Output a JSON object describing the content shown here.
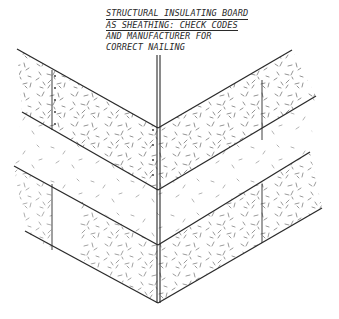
{
  "diagram": {
    "type": "architectural-detail",
    "note": {
      "lines": [
        "STRUCTURAL INSULATING BOARD",
        "AS SHEATHING:  CHECK CODES",
        "AND MANUFACTURER FOR",
        "CORRECT NAILING"
      ]
    },
    "colors": {
      "line": "#2a2a2a",
      "texture": "#4a4a4a",
      "background": "#ffffff"
    },
    "corner": {
      "x": 158,
      "top": 55,
      "bottom": 303
    },
    "left_face": {
      "courses": [
        {
          "top": [
            [
              17,
              49
            ],
            [
              158,
              128
            ]
          ],
          "bottom": [
            [
              22,
              112
            ],
            [
              158,
              190
            ]
          ],
          "joint_x": 52
        },
        {
          "top": [
            [
              22,
              112
            ],
            [
              158,
              190
            ]
          ],
          "bottom": [
            [
              14,
              166
            ],
            [
              158,
              245
            ]
          ],
          "joint_x": null
        },
        {
          "top": [
            [
              14,
              166
            ],
            [
              158,
              245
            ]
          ],
          "bottom": [
            [
              25,
              231
            ],
            [
              158,
              303
            ]
          ],
          "joint_x": 52
        }
      ]
    },
    "right_face": {
      "courses": [
        {
          "top": [
            [
              158,
              128
            ],
            [
              292,
              50
            ]
          ],
          "bottom": [
            [
              158,
              190
            ],
            [
              316,
              96
            ]
          ],
          "joint_x": 262
        },
        {
          "top": [
            [
              158,
              190
            ],
            [
              316,
              96
            ]
          ],
          "bottom": [
            [
              158,
              245
            ],
            [
              310,
              152
            ]
          ],
          "joint_x": null
        },
        {
          "top": [
            [
              158,
              245
            ],
            [
              310,
              152
            ]
          ],
          "bottom": [
            [
              158,
              303
            ],
            [
              322,
              208
            ]
          ],
          "joint_x": 262
        }
      ]
    }
  }
}
